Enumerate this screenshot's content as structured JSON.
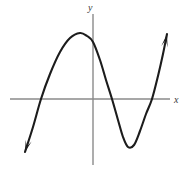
{
  "figure": {
    "kind": "cartesian-graph",
    "width": 188,
    "height": 172,
    "background_color": "#ffffff"
  },
  "labels": {
    "y_axis": "y",
    "x_axis": "x"
  },
  "colors": {
    "axis": "#8a8a8a",
    "curve": "#1c1c1c",
    "label": "#3a3a3a",
    "background": "#ffffff"
  },
  "chart_data": {
    "type": "line",
    "title": "",
    "xlabel": "x",
    "ylabel": "y",
    "grid": false,
    "legend": null,
    "axes": {
      "x_axis_pixel_y": 99,
      "x_axis_pixel_start": 10,
      "x_axis_pixel_end": 170,
      "y_axis_pixel_x": 93,
      "y_axis_pixel_start": 14,
      "y_axis_pixel_end": 165,
      "arrowheads": "none-on-axes",
      "ticks": [],
      "tick_labels": []
    },
    "series": [
      {
        "name": "cubic curve",
        "stroke_color": "#1c1c1c",
        "stroke_width": 2.1,
        "arrow_start": true,
        "arrow_end": true,
        "points_pixel": [
          [
            25,
            152
          ],
          [
            33,
            127
          ],
          [
            41,
            99
          ],
          [
            50,
            74
          ],
          [
            60,
            52
          ],
          [
            70,
            38
          ],
          [
            80,
            33
          ],
          [
            87,
            36
          ],
          [
            93,
            42
          ],
          [
            100,
            60
          ],
          [
            106,
            80
          ],
          [
            112,
            99
          ],
          [
            118,
            120
          ],
          [
            123,
            137
          ],
          [
            128,
            147
          ],
          [
            134,
            145
          ],
          [
            140,
            131
          ],
          [
            146,
            114
          ],
          [
            152,
            99
          ],
          [
            158,
            76
          ],
          [
            163,
            54
          ],
          [
            167,
            34
          ]
        ]
      }
    ],
    "features": {
      "local_maximum_pixel": [
        80,
        33
      ],
      "local_minimum_pixel": [
        128,
        147
      ],
      "y_intercept_pixel": [
        93,
        42
      ],
      "x_intercepts_pixel": [
        [
          41,
          99
        ],
        [
          112,
          99
        ],
        [
          152,
          99
        ]
      ],
      "x_intercept_count": 3,
      "end_behavior": "falls to the lower-left, rises to the upper-right",
      "shape": "odd-degree cubic with positive leading coefficient"
    }
  }
}
